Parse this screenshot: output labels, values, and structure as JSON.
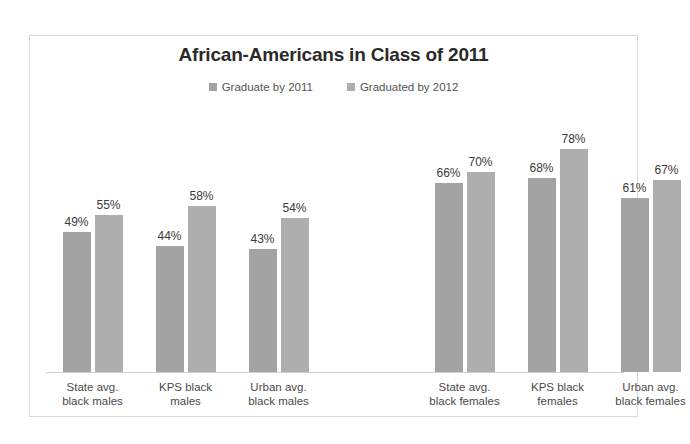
{
  "chart_data": {
    "type": "bar",
    "title": "African-Americans in Class of 2011",
    "xlabel": "",
    "ylabel": "",
    "ylim": [
      0,
      100
    ],
    "grid": false,
    "legend_position": "top-center",
    "categories": [
      "State avg. black males",
      "KPS black males",
      "Urban avg. black males",
      "State avg. black females",
      "KPS black females",
      "Urban avg. black females"
    ],
    "category_lines": [
      [
        "State avg.",
        "black males"
      ],
      [
        "KPS black",
        "males"
      ],
      [
        "Urban avg.",
        "black males"
      ],
      [
        "State avg.",
        "black females"
      ],
      [
        "KPS black",
        "females"
      ],
      [
        "Urban avg.",
        "black females"
      ]
    ],
    "series": [
      {
        "name": "Graduate by 2011",
        "color": "#a3a3a3",
        "values": [
          49,
          44,
          43,
          66,
          68,
          61
        ],
        "labels": [
          "49%",
          "44%",
          "43%",
          "66%",
          "68%",
          "61%"
        ]
      },
      {
        "name": "Graduated by 2012",
        "color": "#aeaeae",
        "values": [
          55,
          58,
          54,
          70,
          78,
          67
        ],
        "labels": [
          "55%",
          "58%",
          "54%",
          "70%",
          "78%",
          "67%"
        ]
      }
    ]
  },
  "legend": {
    "items": [
      {
        "label": "Graduate by 2011",
        "color": "#a3a3a3"
      },
      {
        "label": "Graduated by 2012",
        "color": "#aeaeae"
      }
    ]
  }
}
